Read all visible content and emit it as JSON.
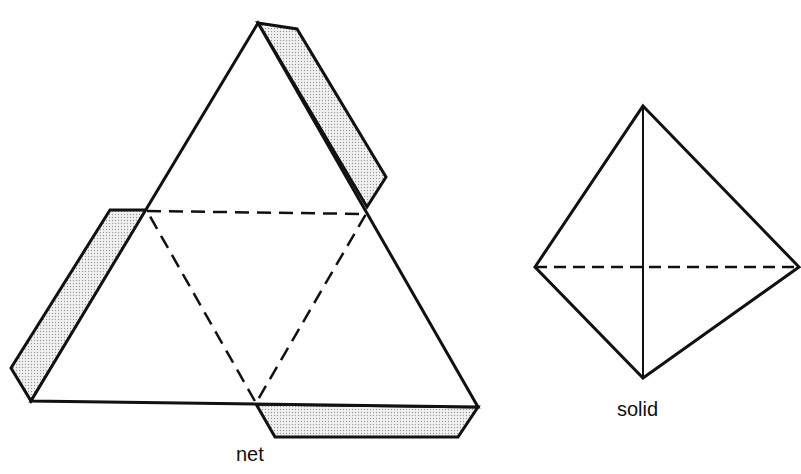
{
  "figure": {
    "net": {
      "label": "net",
      "outer_triangle": [
        [
          258,
          23
        ],
        [
          478,
          407
        ],
        [
          31,
          401
        ]
      ],
      "fold_lines": [
        [
          147,
          211
        ],
        [
          366,
          214
        ],
        [
          256,
          403
        ]
      ],
      "tabs": [
        {
          "name": "top-right-tab",
          "points": [
            [
              258,
              23
            ],
            [
              297,
              29
            ],
            [
              386,
              177
            ],
            [
              367,
              207
            ]
          ]
        },
        {
          "name": "left-tab",
          "points": [
            [
              147,
              210
            ],
            [
              110,
              210
            ],
            [
              11,
              368
            ],
            [
              31,
              401
            ]
          ]
        },
        {
          "name": "bottom-tab",
          "points": [
            [
              256,
              404
            ],
            [
              275,
              437
            ],
            [
              458,
              437
            ],
            [
              478,
              407
            ]
          ]
        }
      ],
      "tab_fill": "#dcdcdc"
    },
    "solid": {
      "label": "solid",
      "vertices": {
        "top": [
          643,
          106
        ],
        "left": [
          535,
          267
        ],
        "right": [
          799,
          267
        ],
        "bottom": [
          643,
          378
        ]
      },
      "hidden_edge": "left-right"
    },
    "stroke_color": "#111111"
  }
}
